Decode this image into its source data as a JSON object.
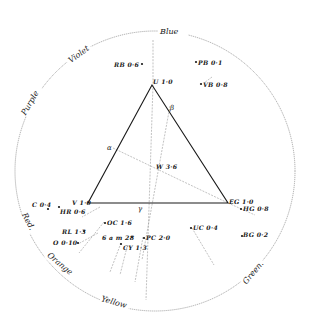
{
  "figure": {
    "colors": {
      "ink": "#1a1a1a",
      "circle": "#888888",
      "dashed": "#999999",
      "background": "#ffffff"
    }
  },
  "circle": {
    "hue_labels": [
      {
        "id": "blue",
        "text": "Blue"
      },
      {
        "id": "violet",
        "text": "Violet"
      },
      {
        "id": "purple",
        "text": "Purple"
      },
      {
        "id": "red",
        "text": "Red."
      },
      {
        "id": "orange",
        "text": "Orange"
      },
      {
        "id": "yellow",
        "text": "Yellow"
      },
      {
        "id": "green",
        "text": "Green."
      }
    ]
  },
  "triangle": {
    "vertices": [
      {
        "id": "U",
        "label": "U 1·0"
      },
      {
        "id": "V",
        "label": "V 1·0"
      },
      {
        "id": "E",
        "label": "EG 1·0"
      }
    ],
    "side_points": [
      {
        "id": "alpha",
        "label": "α"
      },
      {
        "id": "beta",
        "label": "β"
      },
      {
        "id": "gamma",
        "label": "γ"
      }
    ],
    "center": {
      "label": "W 3·6"
    }
  },
  "samples": [
    {
      "id": "RB",
      "label": "RB 0·6"
    },
    {
      "id": "PB",
      "label": "PB 0·1"
    },
    {
      "id": "VB",
      "label": "VB 0·8"
    },
    {
      "id": "C",
      "label": "C 0·4"
    },
    {
      "id": "HR",
      "label": "HR 0·6"
    },
    {
      "id": "RL",
      "label": "RL 1·3"
    },
    {
      "id": "O",
      "label": "O 0·10"
    },
    {
      "id": "OC",
      "label": "OC 1·6"
    },
    {
      "id": "am",
      "label": "6 a m 28"
    },
    {
      "id": "CY",
      "label": "CY 1·3"
    },
    {
      "id": "PC",
      "label": "PC 2·0"
    },
    {
      "id": "UC",
      "label": "UC 0·4"
    },
    {
      "id": "HG",
      "label": "HG 0·8"
    },
    {
      "id": "BG",
      "label": "BG 0·2"
    }
  ]
}
